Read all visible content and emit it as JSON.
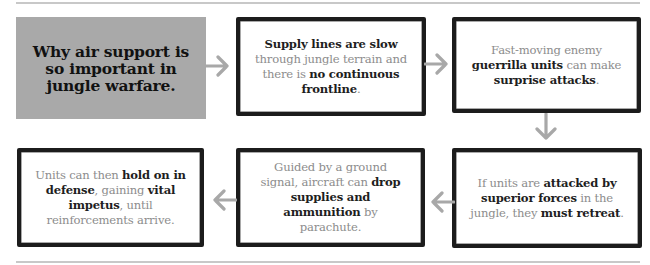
{
  "title_box": {
    "text": "Why air support is so important in jungle warfare."
  },
  "steps": [
    {
      "id": 1,
      "segments": [
        {
          "text": "Supply lines are slow",
          "bold": true
        },
        {
          "text": " through jungle terrain and there is ",
          "bold": false
        },
        {
          "text": "no continuous frontline",
          "bold": true
        },
        {
          "text": ".",
          "bold": false
        }
      ]
    },
    {
      "id": 2,
      "segments": [
        {
          "text": "Fast-moving enemy ",
          "bold": false
        },
        {
          "text": "guerrilla units",
          "bold": true
        },
        {
          "text": " can make ",
          "bold": false
        },
        {
          "text": "surprise attacks",
          "bold": true
        },
        {
          "text": ".",
          "bold": false
        }
      ]
    },
    {
      "id": 3,
      "segments": [
        {
          "text": "If units are ",
          "bold": false
        },
        {
          "text": "attacked by superior forces",
          "bold": true
        },
        {
          "text": " in the jungle, they ",
          "bold": false
        },
        {
          "text": "must retreat",
          "bold": true
        },
        {
          "text": ".",
          "bold": false
        }
      ]
    },
    {
      "id": 4,
      "segments": [
        {
          "text": "Guided by a ground signal, aircraft can ",
          "bold": false
        },
        {
          "text": "drop supplies and ammunition",
          "bold": true
        },
        {
          "text": " by parachute.",
          "bold": false
        }
      ]
    },
    {
      "id": 5,
      "segments": [
        {
          "text": "Units can then ",
          "bold": false
        },
        {
          "text": "hold on in defense",
          "bold": true
        },
        {
          "text": ", gaining ",
          "bold": false
        },
        {
          "text": "vital impetus",
          "bold": true
        },
        {
          "text": ", until reinforcements arrive.",
          "bold": false
        }
      ]
    }
  ],
  "arrows": [
    {
      "from": "title",
      "to": 1,
      "direction": "right"
    },
    {
      "from": 1,
      "to": 2,
      "direction": "right"
    },
    {
      "from": 2,
      "to": 3,
      "direction": "down"
    },
    {
      "from": 3,
      "to": 4,
      "direction": "left"
    },
    {
      "from": 4,
      "to": 5,
      "direction": "left"
    }
  ],
  "colors": {
    "title_fill": "#a9a9a9",
    "box_border": "#1c1c1c",
    "arrow": "#a8a8a8",
    "rule": "#c8c8c8",
    "text_light": "#8c8c8c",
    "text_bold": "#1e1e1e"
  }
}
